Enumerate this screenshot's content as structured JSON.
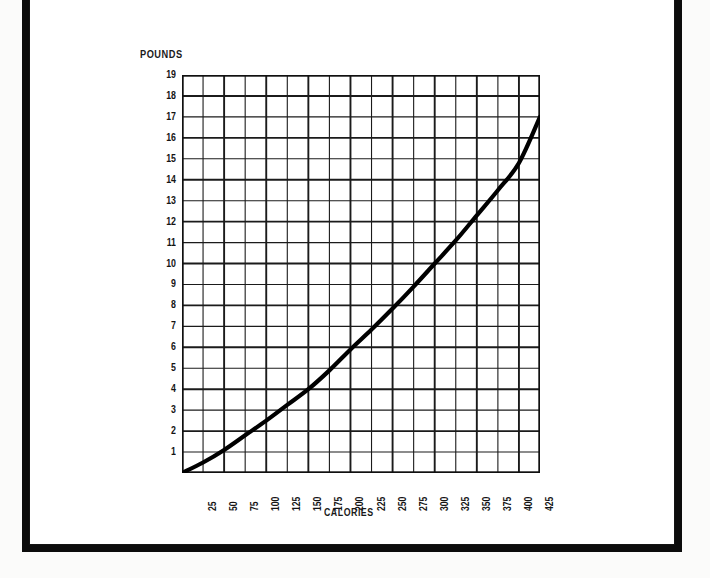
{
  "page": {
    "background_color": "#ffffff",
    "frame_color": "#0c0c0c"
  },
  "axis_titles": {
    "y": "POUNDS",
    "x": "CALORIES"
  },
  "chart_data": {
    "type": "line",
    "title": "",
    "subtitle": "",
    "xlabel": "CALORIES",
    "ylabel": "POUNDS",
    "xlim": [
      0,
      425
    ],
    "ylim": [
      0,
      19
    ],
    "grid": true,
    "legend": null,
    "line_color": "#000000",
    "x_tick_labels": [
      "25",
      "50",
      "75",
      "100",
      "125",
      "150",
      "175",
      "200",
      "225",
      "250",
      "275",
      "300",
      "325",
      "350",
      "375",
      "400",
      "425"
    ],
    "x_ticks": [
      25,
      50,
      75,
      100,
      125,
      150,
      175,
      200,
      225,
      250,
      275,
      300,
      325,
      350,
      375,
      400,
      425
    ],
    "y_tick_labels": [
      "1",
      "2",
      "3",
      "4",
      "5",
      "6",
      "7",
      "8",
      "9",
      "10",
      "11",
      "12",
      "13",
      "14",
      "15",
      "16",
      "17",
      "18",
      "19"
    ],
    "y_ticks": [
      1,
      2,
      3,
      4,
      5,
      6,
      7,
      8,
      9,
      10,
      11,
      12,
      13,
      14,
      15,
      16,
      17,
      18,
      19
    ],
    "series": [
      {
        "name": "weight gain vs daily excess calories",
        "x": [
          0,
          25,
          50,
          75,
          100,
          125,
          150,
          175,
          200,
          225,
          250,
          275,
          300,
          325,
          350,
          375,
          400,
          425
        ],
        "values": [
          0,
          0.5,
          1.1,
          1.8,
          2.5,
          3.25,
          4.0,
          4.9,
          5.9,
          6.85,
          7.85,
          8.9,
          10.0,
          11.1,
          12.3,
          13.5,
          14.8,
          17.0
        ]
      }
    ]
  }
}
